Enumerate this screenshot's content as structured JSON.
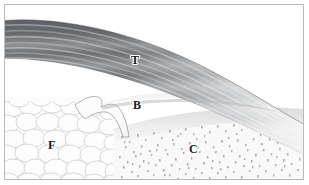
{
  "figure": {
    "width": 309,
    "height": 185,
    "type": "anatomical-histology-illustration",
    "frame": {
      "border_color": "#b9b9b9",
      "background_color": "#ffffff"
    }
  },
  "labels": [
    {
      "key": "T",
      "text": "T",
      "meaning": "tendon",
      "x": 126,
      "y": 49
    },
    {
      "key": "B",
      "text": "B",
      "meaning": "bursa",
      "x": 128,
      "y": 94
    },
    {
      "key": "F",
      "text": "F",
      "meaning": "fat-pad",
      "x": 43,
      "y": 134
    },
    {
      "key": "C",
      "text": "C",
      "meaning": "calcaneus-bone",
      "x": 184,
      "y": 138
    }
  ],
  "regions": {
    "tendon": {
      "label": "T",
      "description": "Dark gray striated fibrous band arcing from upper-left downward to the right and tapering",
      "colors": {
        "dark": "#5f6164",
        "mid": "#8a8d90",
        "light": "#c2c4c6",
        "highlight": "#e8e9ea"
      },
      "striation_count": 9
    },
    "bursa": {
      "label": "B",
      "description": "Pale wedge-shaped cleft between tendon above and fat pad / bone below",
      "colors": {
        "fill": "#fbfbfb",
        "outline": "#9a9a9a"
      }
    },
    "fat_pad": {
      "label": "F",
      "description": "Large rounded adipocyte bubbles, white with light gray cell walls",
      "colors": {
        "fill": "#fcfcfc",
        "cell_wall": "#d3d3d3"
      },
      "cell_count": 46
    },
    "bone": {
      "label": "C",
      "description": "Fine speckled trabecular bone beneath a smooth cortical band",
      "colors": {
        "fill": "#f8f8f8",
        "cortex": "#eceaea",
        "speckle": "#9f9f9f"
      },
      "speckle_count": 760
    }
  },
  "palette": {
    "background": "#ffffff",
    "frame_border": "#b9b9b9",
    "label_text": "#1a1a1a",
    "label_halo": "#ffffff"
  }
}
